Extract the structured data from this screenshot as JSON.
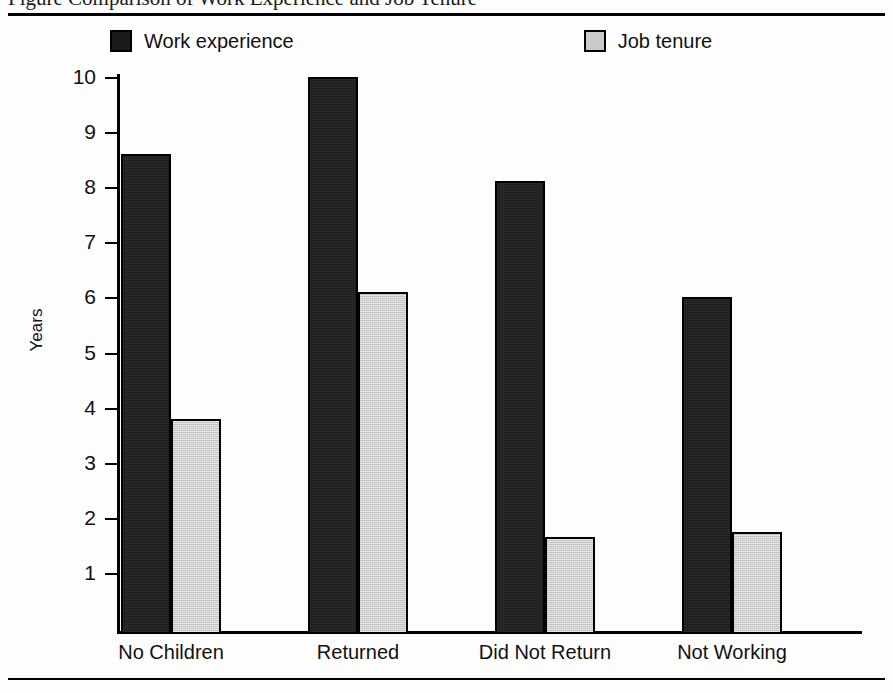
{
  "figure": {
    "caption_fragment": "Figure  Comparison of Work Experience and Job Tenure"
  },
  "legend": {
    "items": [
      {
        "label": "Work experience",
        "swatch": "dark-swatch-icon",
        "color": "#1a1a1a"
      },
      {
        "label": "Job tenure",
        "swatch": "light-swatch-icon",
        "color": "#c9c9c9"
      }
    ]
  },
  "chart_data": {
    "type": "bar",
    "title": "",
    "xlabel": "",
    "ylabel": "Years",
    "ylim": [
      0,
      10.5
    ],
    "yticks": [
      1,
      2,
      3,
      4,
      5,
      6,
      7,
      8,
      9,
      10
    ],
    "ytick_labels": [
      "1",
      "2",
      "3",
      "4",
      "5",
      "6",
      "7",
      "8",
      "9",
      "10"
    ],
    "grid": false,
    "legend_position": "top",
    "categories": [
      "No Children",
      "Returned",
      "Did Not Return",
      "Not Working"
    ],
    "series": [
      {
        "name": "Work experience",
        "color": "#1a1a1a",
        "values": [
          8.6,
          10.0,
          8.1,
          6.0
        ]
      },
      {
        "name": "Job tenure",
        "color": "#c9c9c9",
        "values": [
          3.8,
          6.1,
          1.65,
          1.75
        ]
      }
    ]
  }
}
